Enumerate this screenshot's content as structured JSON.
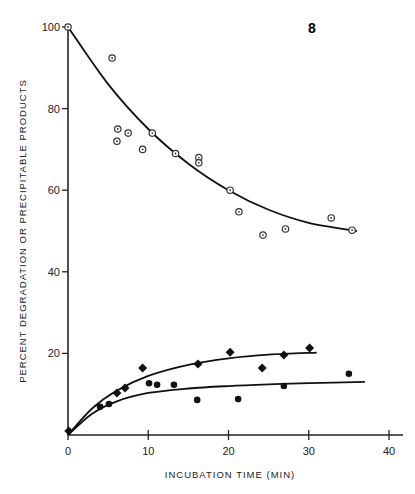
{
  "chart_data": {
    "type": "scatter",
    "title": "",
    "xlabel": "INCUBATION TIME (MIN)",
    "ylabel": "PERCENT DEGRADATION OR PRECIPITABLE PRODUCTS",
    "xlim": [
      0,
      40
    ],
    "ylim": [
      0,
      100
    ],
    "x_ticks": [
      "0",
      "10",
      "20",
      "30",
      "40"
    ],
    "y_ticks": [
      "20",
      "40",
      "60",
      "80",
      "100"
    ],
    "grid": false,
    "legend": null,
    "annotation": "8",
    "series": [
      {
        "name": "precipitable products (open symbols)",
        "marker": "open",
        "points": [
          [
            0,
            100
          ],
          [
            5.5,
            92.4
          ],
          [
            6.2,
            75
          ],
          [
            7.5,
            74
          ],
          [
            6.1,
            72
          ],
          [
            9.3,
            70
          ],
          [
            10.5,
            74
          ],
          [
            13.4,
            69
          ],
          [
            16.3,
            68
          ],
          [
            16.3,
            66.7
          ],
          [
            20.2,
            60
          ],
          [
            21.3,
            54.7
          ],
          [
            24.3,
            49
          ],
          [
            27.1,
            50.5
          ],
          [
            32.8,
            53.2
          ],
          [
            35.4,
            50.2
          ]
        ],
        "fit_curve": [
          [
            0,
            100
          ],
          [
            5,
            86
          ],
          [
            10,
            75
          ],
          [
            15,
            66.5
          ],
          [
            20,
            60
          ],
          [
            25,
            55.2
          ],
          [
            30,
            52
          ],
          [
            36,
            50
          ]
        ]
      },
      {
        "name": "degradation (filled diamonds)",
        "marker": "filled-diamond",
        "points": [
          [
            0.1,
            1.0
          ],
          [
            6.1,
            10.3
          ],
          [
            7.1,
            11.5
          ],
          [
            9.3,
            16.4
          ],
          [
            16.2,
            17.4
          ],
          [
            20.2,
            20.3
          ],
          [
            24.2,
            16.4
          ],
          [
            26.9,
            19.6
          ],
          [
            30.1,
            21.3
          ]
        ],
        "fit_curve": [
          [
            0,
            0
          ],
          [
            3,
            6.5
          ],
          [
            6,
            10.8
          ],
          [
            10,
            14.5
          ],
          [
            15,
            17.2
          ],
          [
            20,
            18.8
          ],
          [
            25,
            19.7
          ],
          [
            31,
            20.2
          ]
        ]
      },
      {
        "name": "degradation (filled circles)",
        "marker": "filled-circle",
        "points": [
          [
            4.0,
            6.9
          ],
          [
            5.1,
            7.6
          ],
          [
            10.1,
            12.7
          ],
          [
            11.1,
            12.3
          ],
          [
            13.2,
            12.3
          ],
          [
            16.1,
            8.6
          ],
          [
            21.2,
            8.8
          ],
          [
            26.9,
            12.0
          ],
          [
            35.0,
            15.0
          ]
        ],
        "fit_curve": [
          [
            0,
            0
          ],
          [
            3,
            5.2
          ],
          [
            6,
            8.2
          ],
          [
            10,
            10.3
          ],
          [
            15,
            11.4
          ],
          [
            20,
            12
          ],
          [
            25,
            12.4
          ],
          [
            30,
            12.7
          ],
          [
            37,
            13
          ]
        ]
      }
    ]
  }
}
